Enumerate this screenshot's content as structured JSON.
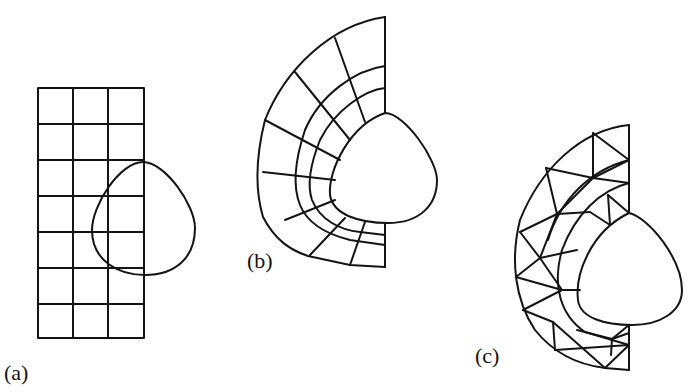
{
  "figure": {
    "panels": [
      {
        "id": "a",
        "label": "(a)",
        "description": "Structured rectangular grid (3 columns x 7 rows) overlapping a rounded teardrop-shaped object"
      },
      {
        "id": "b",
        "label": "(b)",
        "description": "Body-fitted curvilinear quadrilateral mesh around the half-teardrop object"
      },
      {
        "id": "c",
        "label": "(c)",
        "description": "Unstructured triangular mesh around the half-teardrop object"
      }
    ],
    "colors": {
      "line": "#141414",
      "background": "#ffffff"
    }
  }
}
